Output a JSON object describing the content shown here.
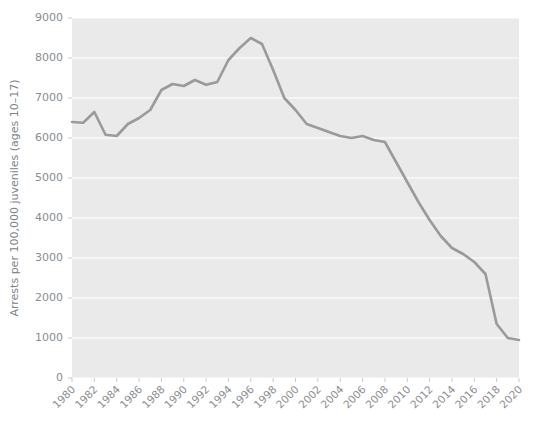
{
  "chart_data": {
    "type": "line",
    "title": "",
    "subtitle": "",
    "xlabel": "",
    "ylabel": "Arrests per 100,000 juveniles (ages 10–17)",
    "xlim": [
      1980,
      2020
    ],
    "ylim": [
      0,
      9000
    ],
    "grid": true,
    "legend": "none",
    "xticks": [
      "1980",
      "1982",
      "1984",
      "1986",
      "1988",
      "1990",
      "1992",
      "1994",
      "1996",
      "1998",
      "2000",
      "2002",
      "2004",
      "2006",
      "2008",
      "2010",
      "2012",
      "2014",
      "2016",
      "2018",
      "2020"
    ],
    "yticks": [
      "0",
      "1000",
      "2000",
      "3000",
      "4000",
      "5000",
      "6000",
      "7000",
      "8000",
      "9000"
    ],
    "series": [
      {
        "name": "Juvenile arrest rate",
        "color": "#9a9a9a",
        "line_width": 2.6,
        "x": [
          1980,
          1981,
          1982,
          1983,
          1984,
          1985,
          1986,
          1987,
          1988,
          1989,
          1990,
          1991,
          1992,
          1993,
          1994,
          1995,
          1996,
          1997,
          1998,
          1999,
          2000,
          2001,
          2002,
          2003,
          2004,
          2005,
          2006,
          2007,
          2008,
          2009,
          2010,
          2011,
          2012,
          2013,
          2014,
          2015,
          2016,
          2017,
          2018,
          2019,
          2020
        ],
        "values": [
          6400,
          6380,
          6650,
          6080,
          6050,
          6350,
          6500,
          6700,
          7200,
          7350,
          7300,
          7450,
          7330,
          7400,
          7950,
          8250,
          8500,
          8350,
          7700,
          7000,
          6700,
          6350,
          6250,
          6150,
          6050,
          6000,
          6050,
          5950,
          5900,
          5400,
          4900,
          4400,
          3950,
          3550,
          3250,
          3100,
          2900,
          2600,
          1350,
          1000,
          950
        ]
      }
    ]
  },
  "axes": {
    "y_axis_label": "Arrests per 100,000 juveniles (ages 10–17)"
  },
  "style": {
    "plot_background": "#eaeaea",
    "figure_background": "#ffffff",
    "gridline_color": "#ffffff",
    "tick_label_color": "#8a8d91",
    "axis_label_color": "#7e8184",
    "line_color": "#9a9a9a"
  }
}
